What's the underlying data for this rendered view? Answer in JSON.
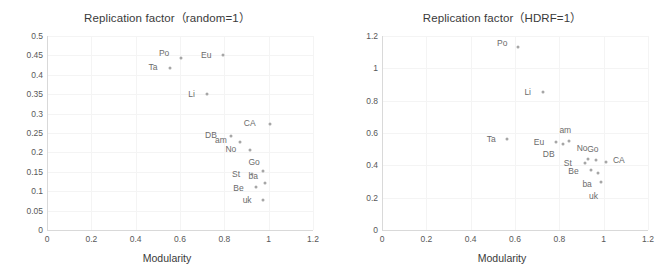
{
  "figure": {
    "panels": [
      {
        "id": "left",
        "title": "Replication factor（random=1）",
        "xlabel": "Modularity",
        "ylabel": ""
      },
      {
        "id": "right",
        "title": "Replication factor（HDRF=1）",
        "xlabel": "Modularity",
        "ylabel": ""
      }
    ]
  },
  "chart_data": [
    {
      "type": "scatter",
      "title": "Replication factor（random=1）",
      "xlabel": "Modularity",
      "ylabel": "",
      "xlim": [
        0,
        1.2
      ],
      "ylim": [
        0,
        0.5
      ],
      "xticks": [
        "0",
        "0.2",
        "0.4",
        "0.6",
        "0.8",
        "1",
        "1.2"
      ],
      "xtick_values": [
        0,
        0.2,
        0.4,
        0.6,
        0.8,
        1,
        1.2
      ],
      "yticks": [
        "0",
        "0.05",
        "0.1",
        "0.15",
        "0.2",
        "0.25",
        "0.3",
        "0.35",
        "0.4",
        "0.45",
        "0.5"
      ],
      "ytick_values": [
        0,
        0.05,
        0.1,
        0.15,
        0.2,
        0.25,
        0.3,
        0.35,
        0.4,
        0.45,
        0.5
      ],
      "grid": true,
      "legend": "none",
      "points": [
        {
          "label": "Po",
          "x": 0.605,
          "y": 0.443,
          "label_dx": -17,
          "label_dy": -5
        },
        {
          "label": "Eu",
          "x": 0.795,
          "y": 0.45,
          "label_dx": -17,
          "label_dy": 0
        },
        {
          "label": "Ta",
          "x": 0.555,
          "y": 0.418,
          "label_dx": -17,
          "label_dy": -1
        },
        {
          "label": "Li",
          "x": 0.72,
          "y": 0.35,
          "label_dx": -15,
          "label_dy": 0
        },
        {
          "label": "CA",
          "x": 1.005,
          "y": 0.272,
          "label_dx": -20,
          "label_dy": -1
        },
        {
          "label": "DB",
          "x": 0.83,
          "y": 0.243,
          "label_dx": -20,
          "label_dy": -1
        },
        {
          "label": "am",
          "x": 0.87,
          "y": 0.226,
          "label_dx": -19,
          "label_dy": -2
        },
        {
          "label": "No",
          "x": 0.915,
          "y": 0.207,
          "label_dx": -19,
          "label_dy": -1
        },
        {
          "label": "Go",
          "x": 0.975,
          "y": 0.152,
          "label_dx": -9,
          "label_dy": -9
        },
        {
          "label": "St",
          "x": 0.925,
          "y": 0.145,
          "label_dx": -16,
          "label_dy": 0
        },
        {
          "label": "ba",
          "x": 0.985,
          "y": 0.12,
          "label_dx": -12,
          "label_dy": -7
        },
        {
          "label": "Be",
          "x": 0.945,
          "y": 0.112,
          "label_dx": -18,
          "label_dy": 1
        },
        {
          "label": "uk",
          "x": 0.975,
          "y": 0.078,
          "label_dx": -16,
          "label_dy": 0
        }
      ]
    },
    {
      "type": "scatter",
      "title": "Replication factor（HDRF=1）",
      "xlabel": "Modularity",
      "ylabel": "",
      "xlim": [
        0,
        1.2
      ],
      "ylim": [
        0,
        1.2
      ],
      "xticks": [
        "0",
        "0.2",
        "0.4",
        "0.6",
        "0.8",
        "1",
        "1.2"
      ],
      "xtick_values": [
        0,
        0.2,
        0.4,
        0.6,
        0.8,
        1,
        1.2
      ],
      "yticks": [
        "0",
        "0.2",
        "0.4",
        "0.6",
        "0.8",
        "1",
        "1.2"
      ],
      "ytick_values": [
        0,
        0.2,
        0.4,
        0.6,
        0.8,
        1,
        1.2
      ],
      "grid": true,
      "legend": "none",
      "points": [
        {
          "label": "Po",
          "x": 0.615,
          "y": 1.135,
          "label_dx": -16,
          "label_dy": -4
        },
        {
          "label": "Li",
          "x": 0.725,
          "y": 0.855,
          "label_dx": -15,
          "label_dy": 0
        },
        {
          "label": "am",
          "x": 0.845,
          "y": 0.55,
          "label_dx": -4,
          "label_dy": -11
        },
        {
          "label": "Ta",
          "x": 0.565,
          "y": 0.565,
          "label_dx": -16,
          "label_dy": 0
        },
        {
          "label": "Eu",
          "x": 0.785,
          "y": 0.545,
          "label_dx": -17,
          "label_dy": 0
        },
        {
          "label": "DB",
          "x": 0.815,
          "y": 0.53,
          "label_dx": -14,
          "label_dy": 10
        },
        {
          "label": "No",
          "x": 0.93,
          "y": 0.44,
          "label_dx": -6,
          "label_dy": -11
        },
        {
          "label": "Go",
          "x": 0.965,
          "y": 0.43,
          "label_dx": -3,
          "label_dy": -11
        },
        {
          "label": "CA",
          "x": 1.01,
          "y": 0.42,
          "label_dx": 13,
          "label_dy": -2
        },
        {
          "label": "St",
          "x": 0.915,
          "y": 0.415,
          "label_dx": -17,
          "label_dy": 0
        },
        {
          "label": "Be",
          "x": 0.945,
          "y": 0.37,
          "label_dx": -18,
          "label_dy": 1
        },
        {
          "label": "ba",
          "x": 0.975,
          "y": 0.35,
          "label_dx": -11,
          "label_dy": 11
        },
        {
          "label": "uk",
          "x": 0.99,
          "y": 0.295,
          "label_dx": -8,
          "label_dy": 14
        }
      ]
    }
  ]
}
